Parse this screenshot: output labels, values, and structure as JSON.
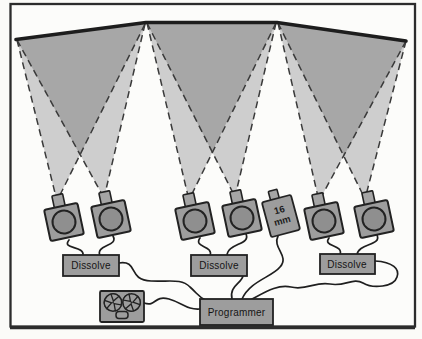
{
  "diagram": {
    "dissolve_units": [
      "Dissolve",
      "Dissolve",
      "Dissolve"
    ],
    "programmer_label": "Programmer",
    "film_projector": {
      "line1": "16",
      "line2": "mm"
    },
    "icons": {
      "screen": "projection-screen",
      "beam_light": "light-beam-cone",
      "beam_dark": "overlap-beam-cone",
      "slide_projector": "slide-projector-icon",
      "lens": "lens-icon",
      "film_projector": "film-projector-16mm-icon",
      "tape_recorder": "tape-recorder-icon",
      "reel": "tape-reel-icon",
      "cable": "signal-cable"
    },
    "colors": {
      "background": "#fbfbf8",
      "frame_stroke": "#2c2c2c",
      "beam_light_fill": "#cecece",
      "beam_dark_fill": "#a7a7a7",
      "device_fill": "#9d9d9d",
      "lens_fill": "#8f8f8f",
      "outline": "#222222",
      "dashed_line": "#3a3a3a",
      "screen_line": "#1d1d1d",
      "text": "#151515"
    }
  }
}
